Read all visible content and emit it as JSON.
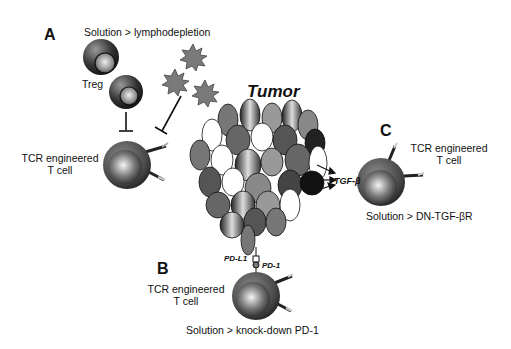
{
  "panels": {
    "a": {
      "letter": "A",
      "solution": "Solution > lymphodepletion",
      "treg_label": "Treg",
      "tcell_label_line1": "TCR engineered",
      "tcell_label_line2": "T cell"
    },
    "b": {
      "letter": "B",
      "tcell_label_line1": "TCR engineered",
      "tcell_label_line2": "T cell",
      "solution": "Solution > knock-down PD-1",
      "pdl1_label": "PD-L1",
      "pd1_label": "PD-1"
    },
    "c": {
      "letter": "C",
      "tcell_label_line1": "TCR engineered",
      "tcell_label_line2": "T cell",
      "solution": "Solution > DN-TGF-βR",
      "tgf_label": "TGF-β"
    }
  },
  "tumor": {
    "title": "Tumor"
  },
  "colors": {
    "cell_outer": "#555555",
    "cell_inner": "#9a9a9a",
    "star": "#7a7a7a",
    "tumor_dark": "#2a2a2a",
    "tumor_mid": "#6e6e6e",
    "tumor_light": "#a8a8a8"
  }
}
